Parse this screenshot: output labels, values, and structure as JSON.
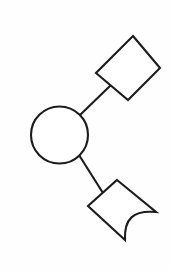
{
  "page": {
    "background_color": "#fefefe",
    "width": 170,
    "height": 271
  },
  "diagram": {
    "name": "three-node-line-drawing",
    "stroke_color": "#1c1c1c",
    "fill_color": "#ffffff",
    "stroke_width": 2.1,
    "nodes": [
      {
        "id": "node-circle",
        "shape": "circle",
        "label": "",
        "center_x": 59.5,
        "center_y": 135,
        "radius": 28.5
      },
      {
        "id": "node-rotated-rectangle",
        "shape": "rotated-rectangle",
        "label": "",
        "points": "133,36 160,68 128,100 96,73"
      },
      {
        "id": "node-curved-corner-quadrilateral",
        "shape": "curved-corner-quadrilateral",
        "label": "",
        "path": "M117,180 L156,212 C133,210 124,219 125,240 L88,206 Z",
        "vertices": "117,180 156,212 125,240 88,206",
        "curve_note": "concave-curve-between-right-and-bottom-vertices"
      }
    ],
    "edges": [
      {
        "id": "edge-circle-to-rectangle",
        "from": "node-circle",
        "to": "node-rotated-rectangle",
        "x1": 80,
        "y1": 115,
        "x2": 111,
        "y2": 85
      },
      {
        "id": "edge-circle-to-curved-quad",
        "from": "node-circle",
        "to": "node-curved-corner-quadrilateral",
        "x1": 79,
        "y1": 155,
        "x2": 103,
        "y2": 193
      }
    ]
  }
}
